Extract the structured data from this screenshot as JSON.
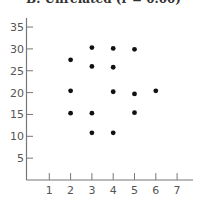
{
  "chart_data": {
    "type": "scatter",
    "title": "B. Unrelated (r = 0.00)",
    "xlabel": "",
    "ylabel": "",
    "xlim": [
      0,
      7.8
    ],
    "ylim": [
      0,
      35
    ],
    "x_ticks": [
      1,
      2,
      3,
      4,
      5,
      6,
      7
    ],
    "y_ticks": [
      5,
      10,
      15,
      20,
      25,
      30,
      35
    ],
    "grid": false,
    "legend": null,
    "points": [
      {
        "x": 3,
        "y": 30.3
      },
      {
        "x": 4,
        "y": 30.1
      },
      {
        "x": 5,
        "y": 29.9
      },
      {
        "x": 2,
        "y": 27.5
      },
      {
        "x": 3,
        "y": 26
      },
      {
        "x": 4,
        "y": 25.8
      },
      {
        "x": 2,
        "y": 20.4
      },
      {
        "x": 4,
        "y": 20.2
      },
      {
        "x": 5,
        "y": 19.7
      },
      {
        "x": 6,
        "y": 20.4
      },
      {
        "x": 2,
        "y": 15.3
      },
      {
        "x": 3,
        "y": 15.3
      },
      {
        "x": 5,
        "y": 15.4
      },
      {
        "x": 3,
        "y": 10.8
      },
      {
        "x": 4,
        "y": 10.8
      }
    ]
  },
  "colors": {
    "axis": "#777777",
    "point": "#111111",
    "label": "#555555"
  }
}
